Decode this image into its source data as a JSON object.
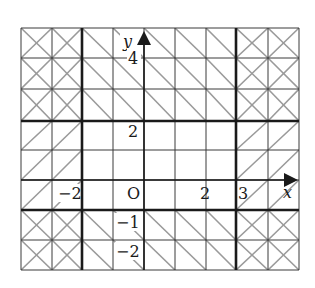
{
  "figure": {
    "type": "coordinate-plane-region-diagram",
    "axes": {
      "x_label": "x",
      "y_label": "y",
      "origin_label": "O",
      "x_range": [
        -4,
        5
      ],
      "y_range": [
        -3,
        5
      ]
    },
    "tick_labels": {
      "x_neg2": "−2",
      "x_2": "2",
      "x_3": "3",
      "y_4": "4",
      "y_2": "2",
      "y_neg1": "−1",
      "y_neg2": "−2"
    },
    "boundary_lines": [
      {
        "kind": "vertical",
        "value": -2
      },
      {
        "kind": "vertical",
        "value": 3
      },
      {
        "kind": "horizontal",
        "value": 2
      },
      {
        "kind": "horizontal",
        "value": -1
      }
    ],
    "regions": [
      {
        "condition": "x < -2 or x > 3",
        "hatch": "forward-slash"
      },
      {
        "condition": "y > 2 or y < -1",
        "hatch": "back-slash"
      },
      {
        "condition": "both",
        "hatch": "cross"
      },
      {
        "condition": "-2 <= x <= 3 and -1 <= y <= 2",
        "hatch": "none"
      }
    ],
    "colors": {
      "grid": "#3a3a3a",
      "bold": "#1a1a1a",
      "hatch": "#9a9a9a"
    }
  }
}
